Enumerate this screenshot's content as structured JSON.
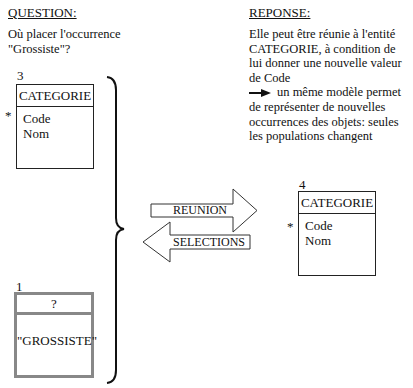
{
  "question": {
    "heading": "QUESTION:",
    "lines": [
      "Où placer l'occurrence",
      "\"Grossiste\"?"
    ]
  },
  "response": {
    "heading": "REPONSE:",
    "lines": [
      "Elle peut être réunie à l'entité",
      "CATEGORIE, à condition de",
      "lui donner une nouvelle valeur",
      "de Code"
    ],
    "conclusion_lines": [
      "un même modèle permet",
      "de représenter de nouvelles",
      "occurrences des objets: seules",
      "les populations changent"
    ],
    "arrow_icon": "right-arrow"
  },
  "entity_left": {
    "number": "3",
    "name": "CATEGORIE",
    "identifier_marker": "*",
    "attributes": [
      "Code",
      "Nom"
    ]
  },
  "entity_occurrence": {
    "number": "1",
    "name": "?",
    "value": "\"GROSSISTE\""
  },
  "entity_right": {
    "number": "4",
    "name": "CATEGORIE",
    "identifier_marker": "*",
    "attributes": [
      "Code",
      "Nom"
    ]
  },
  "arrows": {
    "reunion": "REUNION",
    "selections": "SELECTIONS"
  }
}
